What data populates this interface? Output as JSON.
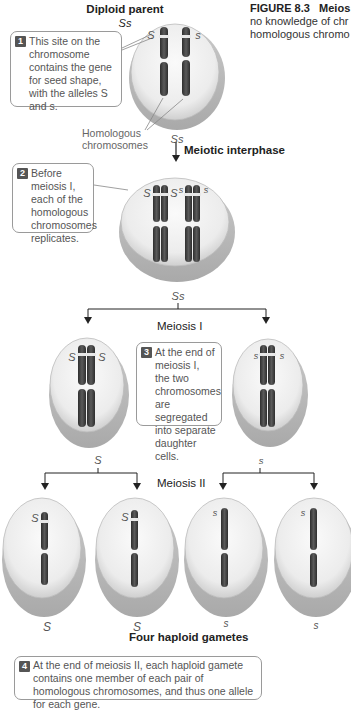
{
  "figure": {
    "number_label": "FIGURE 8.3",
    "title_fragment": "Meios",
    "caption_line2": "no knowledge of chr",
    "caption_line3": "homologous chromo"
  },
  "top": {
    "title": "Diploid parent",
    "genotype": "Ss",
    "allele_left": "S",
    "allele_right": "s",
    "homologous_label_line1": "Homologous",
    "homologous_label_line2": "chromosomes",
    "genotype_below": "Ss"
  },
  "steps": {
    "meiotic_interphase": "Meiotic interphase",
    "meiosis_1": "Meiosis I",
    "meiosis_2": "Meiosis II",
    "result": "Four haploid gametes"
  },
  "callouts": [
    {
      "number": "1",
      "text": "This site on the chromosome contains the gene for seed shape, with the alleles S and s."
    },
    {
      "number": "2",
      "text": "Before meiosis I, each of the homologous chromosomes replicates."
    },
    {
      "number": "3",
      "text": "At the end of meiosis I, the two chromosomes are segregated into separate daughter cells."
    },
    {
      "number": "4",
      "text": "At the end of meiosis II, each haploid gamete contains one member of each pair of homologous chromosomes, and thus one allele for each gene."
    }
  ],
  "replicated_cell": {
    "alleles": [
      "S",
      "S",
      "s",
      "s"
    ],
    "genotype_below": "Ss"
  },
  "meiosis1_cells": [
    {
      "alleles": [
        "S",
        "S"
      ],
      "genotype_below": "S"
    },
    {
      "alleles": [
        "s",
        "s"
      ],
      "genotype_below": "s"
    }
  ],
  "gametes": [
    {
      "allele": "S",
      "label": "S"
    },
    {
      "allele": "S",
      "label": "S"
    },
    {
      "allele": "s",
      "label": "s"
    },
    {
      "allele": "s",
      "label": "s"
    }
  ],
  "colors": {
    "chromosome": "#4a4a4a",
    "chromosome_dark": "#2e2e2e",
    "cell_fill": "#f2f2f2",
    "cell_shadow": "#bdbdbd",
    "allele_band": "#e8e8e8",
    "callout_border": "#9a9a9a",
    "badge": "#555555"
  }
}
